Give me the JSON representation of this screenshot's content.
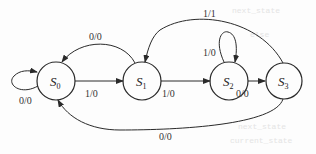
{
  "diagram": {
    "type": "finite-state-machine",
    "colors": {
      "line": "#2a2a2a",
      "text": "#222222",
      "background": "#fdfdfd"
    },
    "states": [
      {
        "id": "S0",
        "base": "S",
        "sub": "0",
        "cx": 56,
        "cy": 81,
        "r": 19
      },
      {
        "id": "S1",
        "base": "S",
        "sub": "1",
        "cx": 142,
        "cy": 81,
        "r": 19
      },
      {
        "id": "S2",
        "base": "S",
        "sub": "2",
        "cx": 229,
        "cy": 81,
        "r": 19
      },
      {
        "id": "S3",
        "base": "S",
        "sub": "3",
        "cx": 284,
        "cy": 81,
        "r": 18
      }
    ],
    "transitions": [
      {
        "from": "S0",
        "to": "S0",
        "label": "0/0"
      },
      {
        "from": "S0",
        "to": "S1",
        "label": "1/0"
      },
      {
        "from": "S1",
        "to": "S0",
        "label": "0/0"
      },
      {
        "from": "S1",
        "to": "S2",
        "label": "1/0"
      },
      {
        "from": "S2",
        "to": "S2",
        "label": "1/0"
      },
      {
        "from": "S2",
        "to": "S3",
        "label": "0/0"
      },
      {
        "from": "S3",
        "to": "S1",
        "label": "1/1"
      },
      {
        "from": "S3",
        "to": "S0",
        "label": "0/0"
      }
    ]
  },
  "bleed_text": [
    "next_state",
    "else",
    "next_state",
    "current_state"
  ]
}
